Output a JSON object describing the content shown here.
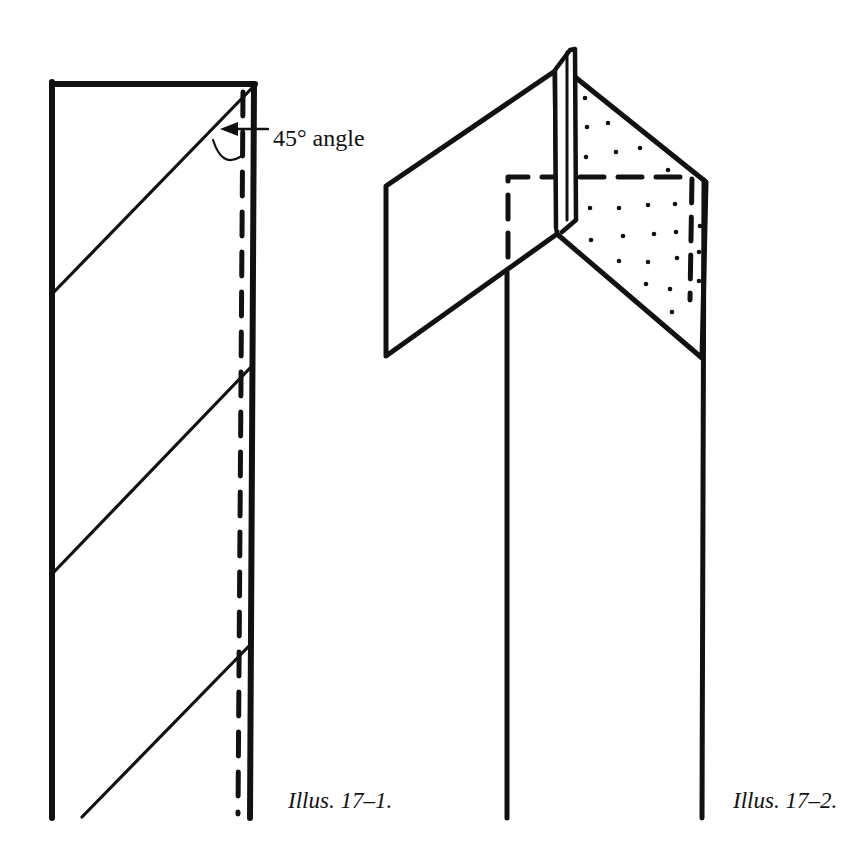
{
  "figures": [
    {
      "id": "illus-17-1",
      "caption": "Illus. 17–1.",
      "annotation": "45° angle",
      "description": "Long fabric strip with diagonal lines at 45° and a dashed seam line along the right edge"
    },
    {
      "id": "illus-17-2",
      "caption": "Illus. 17–2.",
      "description": "Strip folded at top into a pointed shape with a stippled back panel and dashed stitching outline"
    }
  ],
  "colors": {
    "ink": "#111111",
    "background": "#ffffff"
  }
}
